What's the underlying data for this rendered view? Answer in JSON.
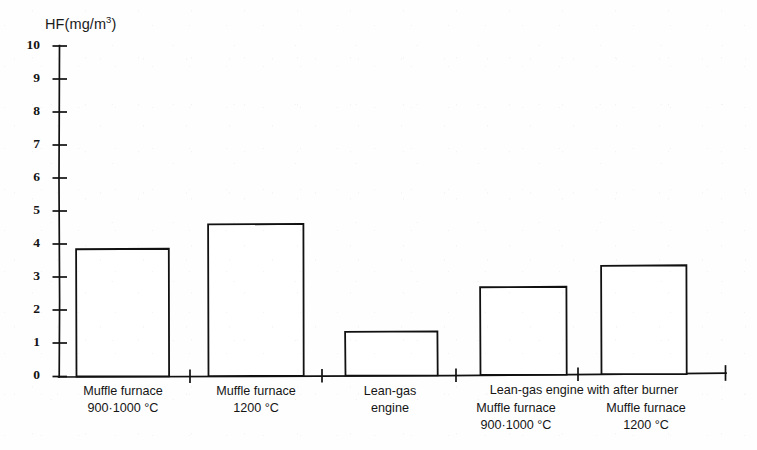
{
  "chart_data": {
    "type": "bar",
    "title": "",
    "ylabel": "HF(mg/m3)",
    "ylabel_base": "HF(mg/m",
    "ylabel_sup": "3",
    "ylabel_tail": ")",
    "xlabel": "",
    "ylim": [
      0,
      10
    ],
    "ytick_values": [
      0,
      1,
      2,
      3,
      4,
      5,
      6,
      7,
      8,
      9,
      10
    ],
    "ytick_labels": [
      "0",
      "1",
      "2",
      "3",
      "4",
      "5",
      "6",
      "7",
      "8",
      "9",
      "10"
    ],
    "grid": false,
    "legend": "none",
    "categories": [
      "Muffle furnace 900-1000 °C",
      "Muffle furnace 1200 °C",
      "Lean-gas engine",
      "Muffle furnace 900-1000 °C",
      "Muffle furnace 1200 °C"
    ],
    "values": [
      3.85,
      4.6,
      1.35,
      2.7,
      3.35
    ],
    "bar_color": "#ffffff",
    "bar_edge_color": "#111111",
    "axis_color": "#111111",
    "background_color": "#fefefe",
    "group_headers": [
      {
        "label": "Lean-gas engine with after burner",
        "covers": [
          3,
          4
        ]
      }
    ]
  },
  "axis": {
    "y_title_base": "HF(mg/m",
    "y_title_sup": "3",
    "y_title_tail": ")",
    "ticks": [
      {
        "label": "10"
      },
      {
        "label": "9"
      },
      {
        "label": "8"
      },
      {
        "label": "7"
      },
      {
        "label": "6"
      },
      {
        "label": "5"
      },
      {
        "label": "4"
      },
      {
        "label": "3"
      },
      {
        "label": "2"
      },
      {
        "label": "1"
      },
      {
        "label": "0"
      }
    ]
  },
  "xlabels": [
    {
      "line1": "Muffle furnace",
      "line2": "900·1000 °C"
    },
    {
      "line1": "Muffle furnace",
      "line2": "1200 °C"
    },
    {
      "line1": "Lean-gas",
      "line2": "engine"
    },
    {
      "line1": "Muffle furnace",
      "line2": "900·1000 °C"
    },
    {
      "line1": "Muffle furnace",
      "line2": "1200 °C"
    }
  ],
  "group_header": {
    "label": "Lean-gas engine with after burner"
  }
}
